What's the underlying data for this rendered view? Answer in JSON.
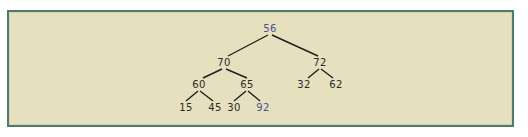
{
  "diagram": {
    "type": "binary-tree",
    "colors": {
      "background": "#e6e0bf",
      "border": "#4f7a6e",
      "node_text": "#2a2a2a",
      "highlight_text": "#4a4f96",
      "edge": "#1e1e1e"
    },
    "nodes": [
      {
        "id": "n56",
        "label": "56",
        "x": 270,
        "y": 32,
        "highlight": true
      },
      {
        "id": "n70",
        "label": "70",
        "x": 224,
        "y": 66,
        "highlight": false
      },
      {
        "id": "n72",
        "label": "72",
        "x": 320,
        "y": 66,
        "highlight": false
      },
      {
        "id": "n60",
        "label": "60",
        "x": 199,
        "y": 88,
        "highlight": false
      },
      {
        "id": "n65",
        "label": "65",
        "x": 247,
        "y": 88,
        "highlight": false
      },
      {
        "id": "n32",
        "label": "32",
        "x": 304,
        "y": 88,
        "highlight": false
      },
      {
        "id": "n62",
        "label": "62",
        "x": 336,
        "y": 88,
        "highlight": false
      },
      {
        "id": "n15",
        "label": "15",
        "x": 186,
        "y": 111,
        "highlight": false
      },
      {
        "id": "n45",
        "label": "45",
        "x": 215,
        "y": 111,
        "highlight": false
      },
      {
        "id": "n30",
        "label": "30",
        "x": 234,
        "y": 111,
        "highlight": false
      },
      {
        "id": "n92",
        "label": "92",
        "x": 263,
        "y": 111,
        "highlight": true
      }
    ],
    "edges": [
      {
        "from": "56",
        "to": "70"
      },
      {
        "from": "56",
        "to": "72"
      },
      {
        "from": "70",
        "to": "60"
      },
      {
        "from": "70",
        "to": "65"
      },
      {
        "from": "72",
        "to": "32"
      },
      {
        "from": "72",
        "to": "62"
      },
      {
        "from": "60",
        "to": "15"
      },
      {
        "from": "60",
        "to": "45"
      },
      {
        "from": "65",
        "to": "30"
      },
      {
        "from": "65",
        "to": "92"
      }
    ]
  }
}
